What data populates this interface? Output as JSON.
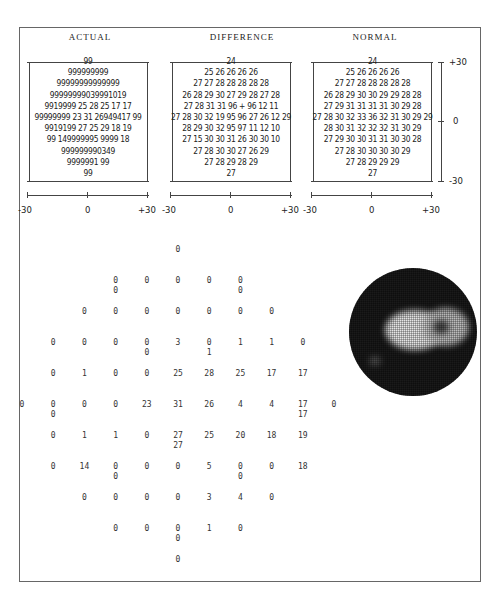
{
  "panels": {
    "actual": {
      "title": "ACTUAL",
      "rows": [
        "99",
        "999999999",
        "99999999999999",
        "99999999039991019",
        "9919999 25 28 25 17 17",
        "99999999 23 31 26949417 99",
        "9919199 27 25 29 18 19",
        "99 149999995 9999 18",
        "999999990349",
        "9999991 99",
        "99"
      ],
      "x_axis": [
        "-30",
        "0",
        "+30"
      ]
    },
    "difference": {
      "title": "DIFFERENCE",
      "rows": [
        "24",
        "25 26 26 26 26",
        "27 27 28 28 28 28 28",
        "26 28 29 30 27 29 28 27 28",
        "27 28 31 31 96 + 96 12 11",
        "27 28 30 32 19 95 96 27 26 12 29",
        "28 29 30 32 95 97 11 12 10",
        "27 15 30 30 31 26 30 30 10",
        "27 28 30 30 27 26 29",
        "27 28 29 28 29",
        "27"
      ],
      "x_axis": [
        "-30",
        "0",
        "+30"
      ]
    },
    "normal": {
      "title": "NORMAL",
      "rows": [
        "24",
        "25 26 26 26 26",
        "27 27 28 28 28 28 28",
        "26 28 29 30 30 29 29 28 28",
        "27 29 31 31 31 31 30 29 28",
        "27 28 30 32 33 36 32 31 30 29 29",
        "28 30 31 32 32 32 31 30 29",
        "27 29 30 30 31 31 30 30 28",
        "27 28 30 30 30 30 29",
        "27 28 29 29 29",
        "27"
      ],
      "x_axis": [
        "-30",
        "0",
        "+30"
      ],
      "y_axis": [
        "+30",
        "0",
        "-30"
      ]
    }
  },
  "chart_data": [
    {
      "type": "table",
      "title": "ACTUAL",
      "description": "Visual field threshold values (dB) at test locations",
      "rows": [
        [
          "99"
        ],
        [
          "99",
          "99",
          "99",
          "99",
          "99"
        ],
        [
          "99",
          "99",
          "99",
          "99",
          "99",
          "99",
          "99"
        ],
        [
          "99",
          "99",
          "99",
          "99",
          "03",
          "99",
          "01",
          "01",
          "99"
        ],
        [
          "99",
          "01",
          "99",
          "99",
          "25",
          "28",
          "25",
          "17",
          "17"
        ],
        [
          "99",
          "99",
          "99",
          "99",
          "23",
          "31",
          "26",
          "94",
          "94",
          "17",
          "99"
        ],
        [
          "99",
          "01",
          "01",
          "99",
          "27",
          "25",
          "20",
          "18",
          "19"
        ],
        [
          "99",
          "14",
          "99",
          "99",
          "99",
          "05",
          "99",
          "99",
          "18"
        ],
        [
          "99",
          "99",
          "99",
          "99",
          "03",
          "04",
          "99"
        ],
        [
          "99",
          "99",
          "99",
          "01",
          "99"
        ],
        [
          "99"
        ]
      ],
      "xlabel": "",
      "xticks": [
        "-30",
        "0",
        "+30"
      ]
    },
    {
      "type": "table",
      "title": "DIFFERENCE",
      "rows": [
        [
          "24"
        ],
        [
          "25",
          "26",
          "26",
          "26",
          "26"
        ],
        [
          "27",
          "27",
          "28",
          "28",
          "28",
          "28",
          "28"
        ],
        [
          "26",
          "28",
          "29",
          "30",
          "27",
          "29",
          "28",
          "27",
          "28"
        ],
        [
          "27",
          "28",
          "31",
          "31",
          "96",
          "+",
          "96",
          "12",
          "11"
        ],
        [
          "27",
          "28",
          "30",
          "32",
          "19",
          "95",
          "96",
          "27",
          "26",
          "12",
          "29"
        ],
        [
          "28",
          "29",
          "30",
          "32",
          "95",
          "97",
          "11",
          "12",
          "10"
        ],
        [
          "27",
          "15",
          "30",
          "30",
          "31",
          "26",
          "30",
          "30",
          "10"
        ],
        [
          "27",
          "28",
          "30",
          "30",
          "27",
          "26",
          "29"
        ],
        [
          "27",
          "28",
          "29",
          "28",
          "29"
        ],
        [
          "27"
        ]
      ],
      "xticks": [
        "-30",
        "0",
        "+30"
      ]
    },
    {
      "type": "table",
      "title": "NORMAL",
      "rows": [
        [
          "24"
        ],
        [
          "25",
          "26",
          "26",
          "26",
          "26"
        ],
        [
          "27",
          "27",
          "28",
          "28",
          "28",
          "28",
          "28"
        ],
        [
          "26",
          "28",
          "29",
          "30",
          "30",
          "29",
          "29",
          "28",
          "28"
        ],
        [
          "27",
          "29",
          "31",
          "31",
          "31",
          "31",
          "30",
          "29",
          "28"
        ],
        [
          "27",
          "28",
          "30",
          "32",
          "33",
          "36",
          "32",
          "31",
          "30",
          "29",
          "29"
        ],
        [
          "28",
          "30",
          "31",
          "32",
          "32",
          "32",
          "31",
          "30",
          "29"
        ],
        [
          "27",
          "29",
          "30",
          "30",
          "31",
          "31",
          "30",
          "30",
          "28"
        ],
        [
          "27",
          "28",
          "30",
          "30",
          "30",
          "30",
          "29"
        ],
        [
          "27",
          "28",
          "29",
          "29",
          "29"
        ],
        [
          "27"
        ]
      ],
      "xticks": [
        "-30",
        "0",
        "+30"
      ],
      "yticks": [
        "+30",
        "0",
        "-30"
      ]
    },
    {
      "type": "table",
      "title": "Threshold value grid",
      "rows": [
        {
          "cells": [
            {
              "col": 5,
              "v": "0"
            }
          ]
        },
        {
          "cells": [
            {
              "col": 3,
              "v": "0",
              "v2": "0"
            },
            {
              "col": 4,
              "v": "0"
            },
            {
              "col": 5,
              "v": "0"
            },
            {
              "col": 6,
              "v": "0"
            },
            {
              "col": 7,
              "v": "0",
              "v2": "0"
            }
          ]
        },
        {
          "cells": [
            {
              "col": 2,
              "v": "0"
            },
            {
              "col": 3,
              "v": "0"
            },
            {
              "col": 4,
              "v": "0"
            },
            {
              "col": 5,
              "v": "0"
            },
            {
              "col": 6,
              "v": "0"
            },
            {
              "col": 7,
              "v": "0"
            },
            {
              "col": 8,
              "v": "0"
            }
          ]
        },
        {
          "cells": [
            {
              "col": 1,
              "v": "0"
            },
            {
              "col": 2,
              "v": "0"
            },
            {
              "col": 3,
              "v": "0"
            },
            {
              "col": 4,
              "v": "0",
              "v2": "0"
            },
            {
              "col": 5,
              "v": "3"
            },
            {
              "col": 6,
              "v": "0",
              "v2": "1"
            },
            {
              "col": 7,
              "v": "1"
            },
            {
              "col": 8,
              "v": "1"
            },
            {
              "col": 9,
              "v": "0"
            }
          ]
        },
        {
          "cells": [
            {
              "col": 1,
              "v": "0"
            },
            {
              "col": 2,
              "v": "1"
            },
            {
              "col": 3,
              "v": "0"
            },
            {
              "col": 4,
              "v": "0"
            },
            {
              "col": 5,
              "v": "25"
            },
            {
              "col": 6,
              "v": "28"
            },
            {
              "col": 7,
              "v": "25"
            },
            {
              "col": 8,
              "v": "17"
            },
            {
              "col": 9,
              "v": "17"
            }
          ]
        },
        {
          "cells": [
            {
              "col": 0,
              "v": "0"
            },
            {
              "col": 1,
              "v": "0",
              "v2": "0"
            },
            {
              "col": 2,
              "v": "0"
            },
            {
              "col": 3,
              "v": "0"
            },
            {
              "col": 4,
              "v": "23"
            },
            {
              "col": 5,
              "v": "31"
            },
            {
              "col": 6,
              "v": "26"
            },
            {
              "col": 7,
              "v": "4"
            },
            {
              "col": 8,
              "v": "4"
            },
            {
              "col": 9,
              "v": "17",
              "v2": "17"
            },
            {
              "col": 10,
              "v": "0"
            }
          ]
        },
        {
          "cells": [
            {
              "col": 1,
              "v": "0"
            },
            {
              "col": 2,
              "v": "1"
            },
            {
              "col": 3,
              "v": "1"
            },
            {
              "col": 4,
              "v": "0"
            },
            {
              "col": 5,
              "v": "27",
              "v2": "27"
            },
            {
              "col": 6,
              "v": "25"
            },
            {
              "col": 7,
              "v": "20"
            },
            {
              "col": 8,
              "v": "18"
            },
            {
              "col": 9,
              "v": "19"
            }
          ]
        },
        {
          "cells": [
            {
              "col": 1,
              "v": "0"
            },
            {
              "col": 2,
              "v": "14"
            },
            {
              "col": 3,
              "v": "0",
              "v2": "0"
            },
            {
              "col": 4,
              "v": "0"
            },
            {
              "col": 5,
              "v": "0"
            },
            {
              "col": 6,
              "v": "5"
            },
            {
              "col": 7,
              "v": "0",
              "v2": "0"
            },
            {
              "col": 8,
              "v": "0"
            },
            {
              "col": 9,
              "v": "18"
            }
          ]
        },
        {
          "cells": [
            {
              "col": 2,
              "v": "0"
            },
            {
              "col": 3,
              "v": "0"
            },
            {
              "col": 4,
              "v": "0"
            },
            {
              "col": 5,
              "v": "0"
            },
            {
              "col": 6,
              "v": "3"
            },
            {
              "col": 7,
              "v": "4"
            },
            {
              "col": 8,
              "v": "0"
            }
          ]
        },
        {
          "cells": [
            {
              "col": 3,
              "v": "0"
            },
            {
              "col": 4,
              "v": "0"
            },
            {
              "col": 5,
              "v": "0",
              "v2": "0"
            },
            {
              "col": 6,
              "v": "1"
            },
            {
              "col": 7,
              "v": "0"
            }
          ]
        },
        {
          "cells": [
            {
              "col": 5,
              "v": "0"
            }
          ]
        }
      ]
    },
    {
      "type": "heatmap",
      "title": "Grayscale visual field map",
      "description": "Circular grayscale plot, dark overall with a bright region right of center"
    }
  ]
}
